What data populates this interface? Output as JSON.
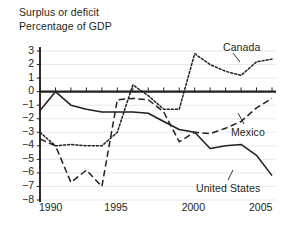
{
  "chart_data": {
    "type": "line",
    "title": "Surplus or deficit",
    "subtitle": "Percentage of GDP",
    "xlabel": "",
    "ylabel": "",
    "xlim": [
      1990,
      2005
    ],
    "ylim": [
      -8,
      3
    ],
    "ytick_values": [
      3,
      2,
      1,
      0,
      -1,
      -2,
      -3,
      -4,
      -5,
      -6,
      -7,
      -8
    ],
    "ytick_labels": [
      "3",
      "2",
      "1",
      "0",
      "−1",
      "−2",
      "−3",
      "−4",
      "−5",
      "−6",
      "−7",
      "−8"
    ],
    "xtick_values": [
      1990,
      1995,
      2000,
      2005
    ],
    "xtick_labels": [
      "1990",
      "1995",
      "2000",
      "2005"
    ],
    "minor_xticks_every": 1,
    "grid": "horizontal-light",
    "zero_line": true,
    "legend_position": "inline-annotations",
    "x": [
      1990,
      1991,
      1992,
      1993,
      1994,
      1995,
      1996,
      1997,
      1998,
      1999,
      2000,
      2001,
      2002,
      2003,
      2004,
      2005
    ],
    "series": [
      {
        "name": "Canada",
        "style": "dotted",
        "values": [
          -3.0,
          -4.0,
          -3.9,
          -4.0,
          -4.0,
          -3.0,
          0.5,
          -0.3,
          -1.3,
          -1.3,
          2.8,
          2.0,
          1.5,
          1.2,
          2.2,
          2.4
        ]
      },
      {
        "name": "Mexico",
        "style": "dashed",
        "values": [
          -3.5,
          -4.0,
          -6.7,
          -5.8,
          -7.0,
          -0.6,
          -0.5,
          -0.6,
          -1.5,
          -3.7,
          -3.0,
          -3.1,
          -2.7,
          -2.2,
          -1.2,
          -0.5
        ]
      },
      {
        "name": "United States",
        "style": "solid",
        "values": [
          -1.4,
          0.0,
          -1.0,
          -1.3,
          -1.5,
          -1.5,
          -1.5,
          -1.6,
          -2.2,
          -2.8,
          -3.0,
          -4.2,
          -4.0,
          -3.9,
          -4.7,
          -6.2
        ]
      }
    ],
    "annotations": [
      {
        "text": "Canada",
        "series": "Canada",
        "leader": true
      },
      {
        "text": "Mexico",
        "series": "Mexico",
        "leader": true
      },
      {
        "text": "United States",
        "series": "United States",
        "leader": true
      }
    ],
    "colors": {
      "ink": "#231f20",
      "grid": "#e8e8e8",
      "background": "#ffffff"
    }
  },
  "title": {
    "line1": "Surplus or deficit",
    "line2": "Percentage of GDP"
  },
  "labels": {
    "canada": "Canada",
    "mexico": "Mexico",
    "united_states": "United States"
  }
}
